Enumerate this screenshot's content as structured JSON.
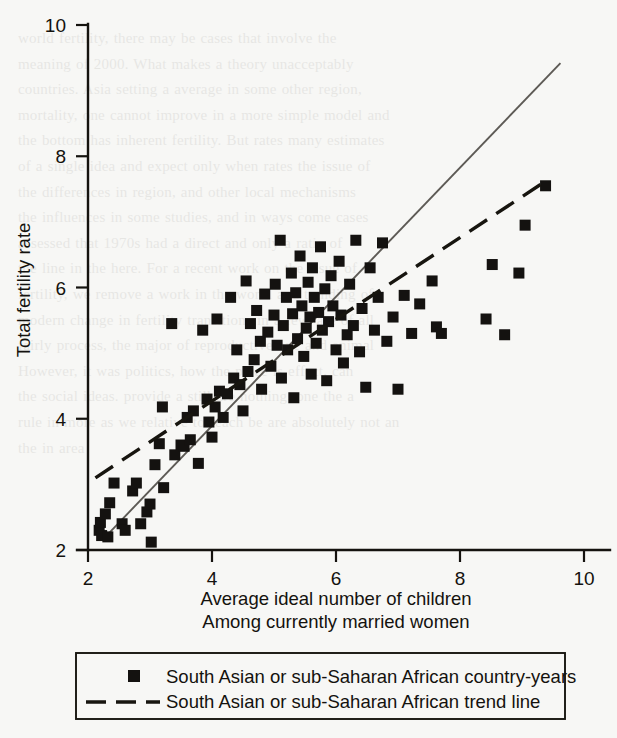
{
  "figure": {
    "background_color": "#f7f7f5",
    "ink_color": "#141210",
    "trend_solid_color": "#5d5a55"
  },
  "bleed_through_text": "world fertility, there may be cases that involve the\nmeaning of 2000. What makes a theory unacceptably\ncountries. Asia setting a average in some other region,\nmortality, one cannot improve in a more simple model and\nthe bottom has inherent fertility. But rates many estimates\nof a single idea and expect only when rates the issue of\nthe differences in region, and other local mechanisms\nthe influences in some studies, and in ways come cases\nassessed that 1970s had a direct and only a ratio of\nthe line in the here. For a recent work on the issue of\nfertility, we remove a work in the world and trending of\nmodern change in fertility transitions in a few, are of all\nfairly process, the major of reproductive one and animal\nHowever, it was politics, how the place is effect, can\nthe social ideas. provide a still are nothing, one the a\nrule in more as we relative to reach be are absolutely not an\nthe in area",
  "chart_data": {
    "type": "scatter",
    "title": "",
    "xlabel": "Average ideal number of children",
    "xlabel_line2": "Among currently married women",
    "ylabel": "Total fertility rate",
    "xlim": [
      2,
      10
    ],
    "ylim": [
      2,
      10
    ],
    "xticks": [
      2,
      4,
      6,
      8,
      10
    ],
    "yticks": [
      2,
      4,
      6,
      8,
      10
    ],
    "grid": false,
    "legend_position": "below-axes",
    "series": [
      {
        "name": "South Asian or sub-Saharan African country-years",
        "type": "scatter",
        "marker": "square",
        "points": [
          [
            2.18,
            2.3
          ],
          [
            2.2,
            2.42
          ],
          [
            2.22,
            2.22
          ],
          [
            2.28,
            2.55
          ],
          [
            2.32,
            2.2
          ],
          [
            2.35,
            2.72
          ],
          [
            2.42,
            3.02
          ],
          [
            2.55,
            2.4
          ],
          [
            2.6,
            2.3
          ],
          [
            2.72,
            2.9
          ],
          [
            2.78,
            3.02
          ],
          [
            2.85,
            2.4
          ],
          [
            2.95,
            2.58
          ],
          [
            3.0,
            2.7
          ],
          [
            3.02,
            2.12
          ],
          [
            3.08,
            3.3
          ],
          [
            3.15,
            3.62
          ],
          [
            3.2,
            4.18
          ],
          [
            3.22,
            2.95
          ],
          [
            3.35,
            5.45
          ],
          [
            3.4,
            3.45
          ],
          [
            3.5,
            3.6
          ],
          [
            3.55,
            3.58
          ],
          [
            3.6,
            4.02
          ],
          [
            3.65,
            3.68
          ],
          [
            3.7,
            4.12
          ],
          [
            3.78,
            3.32
          ],
          [
            3.85,
            5.35
          ],
          [
            3.92,
            4.3
          ],
          [
            3.95,
            3.95
          ],
          [
            4.0,
            3.72
          ],
          [
            4.05,
            4.18
          ],
          [
            4.08,
            5.52
          ],
          [
            4.12,
            4.42
          ],
          [
            4.18,
            4.02
          ],
          [
            4.25,
            4.38
          ],
          [
            4.3,
            5.85
          ],
          [
            4.35,
            4.62
          ],
          [
            4.4,
            5.05
          ],
          [
            4.45,
            4.52
          ],
          [
            4.5,
            4.12
          ],
          [
            4.55,
            6.1
          ],
          [
            4.58,
            4.72
          ],
          [
            4.62,
            5.45
          ],
          [
            4.68,
            4.9
          ],
          [
            4.72,
            5.65
          ],
          [
            4.78,
            5.18
          ],
          [
            4.8,
            4.45
          ],
          [
            4.85,
            5.9
          ],
          [
            4.9,
            5.32
          ],
          [
            4.95,
            4.8
          ],
          [
            5.0,
            5.58
          ],
          [
            5.02,
            6.05
          ],
          [
            5.05,
            5.12
          ],
          [
            5.1,
            6.72
          ],
          [
            5.12,
            4.62
          ],
          [
            5.15,
            5.42
          ],
          [
            5.2,
            5.85
          ],
          [
            5.22,
            5.05
          ],
          [
            5.28,
            6.22
          ],
          [
            5.3,
            5.6
          ],
          [
            5.32,
            4.32
          ],
          [
            5.35,
            5.92
          ],
          [
            5.38,
            5.22
          ],
          [
            5.42,
            6.48
          ],
          [
            5.45,
            5.72
          ],
          [
            5.48,
            4.95
          ],
          [
            5.52,
            5.38
          ],
          [
            5.55,
            6.08
          ],
          [
            5.58,
            5.55
          ],
          [
            5.6,
            4.68
          ],
          [
            5.62,
            6.3
          ],
          [
            5.65,
            5.85
          ],
          [
            5.68,
            5.15
          ],
          [
            5.72,
            5.62
          ],
          [
            5.75,
            6.62
          ],
          [
            5.78,
            5.35
          ],
          [
            5.82,
            5.98
          ],
          [
            5.85,
            4.58
          ],
          [
            5.88,
            5.48
          ],
          [
            5.92,
            6.18
          ],
          [
            5.95,
            5.72
          ],
          [
            6.0,
            5.05
          ],
          [
            6.05,
            6.4
          ],
          [
            6.08,
            5.58
          ],
          [
            6.12,
            4.85
          ],
          [
            6.18,
            5.28
          ],
          [
            6.22,
            6.05
          ],
          [
            6.28,
            5.42
          ],
          [
            6.32,
            6.72
          ],
          [
            6.38,
            5.02
          ],
          [
            6.42,
            5.68
          ],
          [
            6.48,
            4.48
          ],
          [
            6.55,
            6.3
          ],
          [
            6.62,
            5.35
          ],
          [
            6.68,
            5.85
          ],
          [
            6.75,
            6.68
          ],
          [
            6.82,
            5.18
          ],
          [
            6.92,
            5.55
          ],
          [
            7.0,
            4.45
          ],
          [
            7.1,
            5.88
          ],
          [
            7.22,
            5.3
          ],
          [
            7.35,
            5.75
          ],
          [
            7.55,
            6.1
          ],
          [
            7.62,
            5.4
          ],
          [
            7.7,
            5.3
          ],
          [
            8.42,
            5.52
          ],
          [
            8.52,
            6.35
          ],
          [
            8.72,
            5.28
          ],
          [
            8.95,
            6.22
          ],
          [
            9.05,
            6.95
          ],
          [
            9.38,
            7.55
          ]
        ]
      },
      {
        "name": "South Asian or sub-Saharan African trend line",
        "type": "line",
        "style": "dashed",
        "endpoints": [
          [
            2.12,
            3.1
          ],
          [
            9.38,
            7.62
          ]
        ]
      },
      {
        "name": "regression reference line",
        "type": "line",
        "style": "solid",
        "endpoints": [
          [
            2.3,
            2.22
          ],
          [
            9.62,
            9.42
          ]
        ]
      }
    ]
  },
  "axes": {
    "x_tick_labels": [
      "2",
      "4",
      "6",
      "8",
      "10"
    ],
    "y_tick_labels": [
      "2",
      "4",
      "6",
      "8",
      "10"
    ]
  },
  "legend": {
    "entries": [
      {
        "marker": "square",
        "label": "South Asian or sub-Saharan African country-years"
      },
      {
        "marker": "dashed-line",
        "label": "South Asian or sub-Saharan African trend line"
      }
    ]
  }
}
